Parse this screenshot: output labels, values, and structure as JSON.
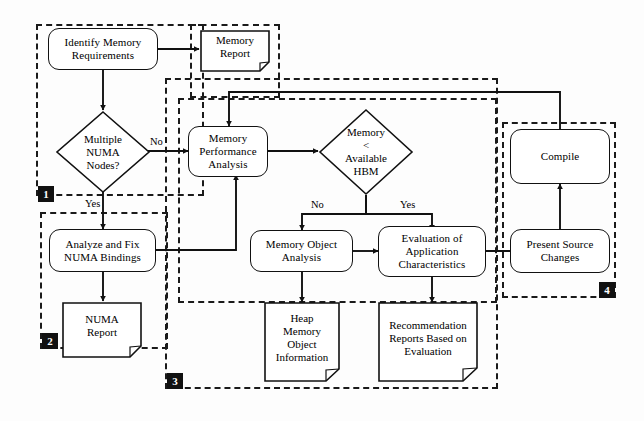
{
  "diagram": {
    "type": "flowchart",
    "line_color": "#111111",
    "group_border_color": "#1a1a1a",
    "badge_bg": "#111111",
    "badge_fg": "#ffffff",
    "node_fill": "#ffffff"
  },
  "groups": [
    {
      "id": "g1",
      "badge": "1"
    },
    {
      "id": "g2",
      "badge": "2"
    },
    {
      "id": "g3",
      "badge": "3"
    },
    {
      "id": "g4",
      "badge": "4"
    }
  ],
  "nodes": {
    "identify_memory_requirements": {
      "label": "Identify Memory\nRequirements",
      "shape": "process"
    },
    "memory_report": {
      "label": "Memory\nReport",
      "shape": "document"
    },
    "multiple_numa_nodes": {
      "label": "Multiple\nNUMA\nNodes?",
      "shape": "decision"
    },
    "analyze_fix_numa_bindings": {
      "label": "Analyze and Fix\nNUMA Bindings",
      "shape": "process"
    },
    "numa_report": {
      "label": "NUMA\nReport",
      "shape": "document"
    },
    "memory_performance_analysis": {
      "label": "Memory\nPerformance\nAnalysis",
      "shape": "process"
    },
    "memory_lt_available_hbm": {
      "label": "Memory\n<\nAvailable\nHBM",
      "shape": "decision"
    },
    "memory_object_analysis": {
      "label": "Memory Object\nAnalysis",
      "shape": "process"
    },
    "heap_memory_object_information": {
      "label": "Heap\nMemory\nObject\nInformation",
      "shape": "document"
    },
    "evaluation_of_application_characteristics": {
      "label": "Evaluation of\nApplication\nCharacteristics",
      "shape": "process"
    },
    "recommendation_reports": {
      "label": "Recommendation\nReports Based on\nEvaluation",
      "shape": "document"
    },
    "present_source_changes": {
      "label": "Present Source\nChanges",
      "shape": "process"
    },
    "compile": {
      "label": "Compile",
      "shape": "process"
    }
  },
  "edge_labels": {
    "numa_no": "No",
    "numa_yes": "Yes",
    "hbm_no": "No",
    "hbm_yes": "Yes"
  },
  "edges": [
    {
      "from": "identify_memory_requirements",
      "to": "memory_report",
      "label": ""
    },
    {
      "from": "identify_memory_requirements",
      "to": "multiple_numa_nodes",
      "label": ""
    },
    {
      "from": "multiple_numa_nodes",
      "to": "memory_performance_analysis",
      "label": "No"
    },
    {
      "from": "multiple_numa_nodes",
      "to": "analyze_fix_numa_bindings",
      "label": "Yes"
    },
    {
      "from": "analyze_fix_numa_bindings",
      "to": "numa_report",
      "label": ""
    },
    {
      "from": "analyze_fix_numa_bindings",
      "to": "memory_performance_analysis",
      "label": ""
    },
    {
      "from": "memory_performance_analysis",
      "to": "memory_lt_available_hbm",
      "label": ""
    },
    {
      "from": "memory_lt_available_hbm",
      "to": "memory_object_analysis",
      "label": "No"
    },
    {
      "from": "memory_lt_available_hbm",
      "to": "evaluation_of_application_characteristics",
      "label": "Yes"
    },
    {
      "from": "memory_object_analysis",
      "to": "heap_memory_object_information",
      "label": ""
    },
    {
      "from": "memory_object_analysis",
      "to": "evaluation_of_application_characteristics",
      "label": ""
    },
    {
      "from": "evaluation_of_application_characteristics",
      "to": "recommendation_reports",
      "label": ""
    },
    {
      "from": "evaluation_of_application_characteristics",
      "to": "present_source_changes",
      "label": ""
    },
    {
      "from": "present_source_changes",
      "to": "compile",
      "label": ""
    },
    {
      "from": "compile",
      "to": "memory_performance_analysis",
      "label": ""
    }
  ]
}
